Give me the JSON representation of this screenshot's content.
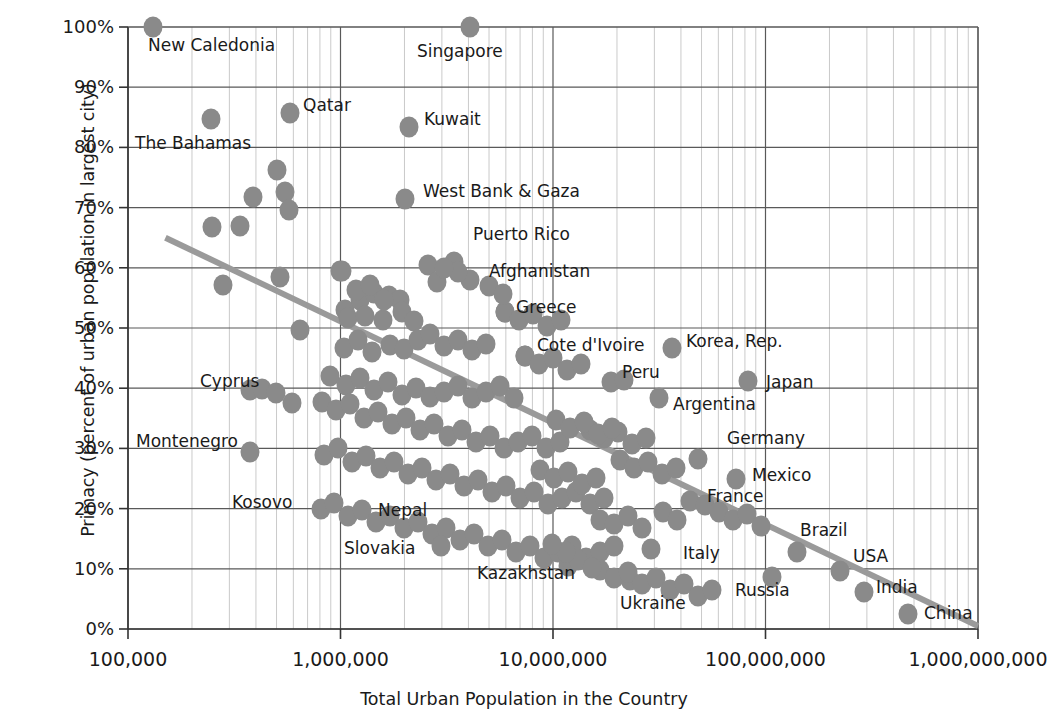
{
  "chart_data": {
    "type": "scatter",
    "title": "",
    "xlabel": "Total Urban Population in the Country",
    "ylabel": "Primacy (percent of urban population in largest city)",
    "xscale": "log",
    "xlim": [
      100000,
      1000000000
    ],
    "ylim": [
      0,
      1.0
    ],
    "grid": true,
    "legend": false,
    "xticklabels": [
      "100,000",
      "1,000,000",
      "10,000,000",
      "100,000,000",
      "1,000,000,000"
    ],
    "xtickvalues": [
      100000,
      1000000,
      10000000,
      100000000,
      1000000000
    ],
    "yticklabels": [
      "0%",
      "10%",
      "20%",
      "30%",
      "40%",
      "50%",
      "60%",
      "70%",
      "80%",
      "90%",
      "100%"
    ],
    "ytickvalues": [
      0,
      10,
      20,
      30,
      40,
      50,
      60,
      70,
      80,
      90,
      100
    ],
    "marker_color": "#8a8a8a",
    "trendline_color": "#9a9a9a",
    "trendline": {
      "x0": 150000,
      "y0": 65.0,
      "x1": 1000000000,
      "y1": 0.5
    },
    "annotations": [
      {
        "label": "New Caledonia",
        "x": 153,
        "y": 27,
        "lx": 148,
        "ly": 46
      },
      {
        "label": "Singapore",
        "x": 470,
        "y": 27,
        "lx": 417,
        "ly": 52
      },
      {
        "label": "Qatar",
        "x": 290,
        "y": 113,
        "lx": 303,
        "ly": 106
      },
      {
        "label": "Kuwait",
        "x": 409,
        "y": 127,
        "lx": 424,
        "ly": 120
      },
      {
        "label": "The Bahamas",
        "x": 211,
        "y": 119,
        "lx": 135,
        "ly": 144
      },
      {
        "label": "West Bank & Gaza",
        "x": 405,
        "y": 199,
        "lx": 423,
        "ly": 192
      },
      {
        "label": "Puerto Rico",
        "x": 454,
        "y": 262,
        "lx": 473,
        "ly": 235
      },
      {
        "label": "Afghanistan",
        "x": 470,
        "y": 280,
        "lx": 489,
        "ly": 272
      },
      {
        "label": "Greece",
        "x": 505,
        "y": 310,
        "lx": 516,
        "ly": 308
      },
      {
        "label": "Cote d'Ivoire",
        "x": 525,
        "y": 355,
        "lx": 537,
        "ly": 346
      },
      {
        "label": "Korea, Rep.",
        "x": 672,
        "y": 348,
        "lx": 686,
        "ly": 342
      },
      {
        "label": "Peru",
        "x": 611,
        "y": 382,
        "lx": 622,
        "ly": 373
      },
      {
        "label": "Japan",
        "x": 748,
        "y": 381,
        "lx": 766,
        "ly": 383
      },
      {
        "label": "Argentina",
        "x": 659,
        "y": 398,
        "lx": 673,
        "ly": 405
      },
      {
        "label": "Germany",
        "x": 698,
        "y": 459,
        "lx": 727,
        "ly": 439
      },
      {
        "label": "Mexico",
        "x": 736,
        "y": 479,
        "lx": 752,
        "ly": 476
      },
      {
        "label": "France",
        "x": 690,
        "y": 501,
        "lx": 707,
        "ly": 497
      },
      {
        "label": "Cyprus",
        "x": 250,
        "y": 390,
        "lx": 200,
        "ly": 382
      },
      {
        "label": "Montenegro",
        "x": 250,
        "y": 452,
        "lx": 136,
        "ly": 442
      },
      {
        "label": "Kosovo",
        "x": 321,
        "y": 509,
        "lx": 232,
        "ly": 503
      },
      {
        "label": "Nepal",
        "x": 441,
        "y": 546,
        "lx": 378,
        "ly": 511
      },
      {
        "label": "Slovakia",
        "x": 441,
        "y": 550,
        "lx": 344,
        "ly": 549
      },
      {
        "label": "Kazakhstan",
        "x": 568,
        "y": 565,
        "lx": 477,
        "ly": 574
      },
      {
        "label": "Italy",
        "x": 651,
        "y": 549,
        "lx": 683,
        "ly": 554
      },
      {
        "label": "Ukraine",
        "x": 630,
        "y": 580,
        "lx": 620,
        "ly": 604
      },
      {
        "label": "Russia",
        "x": 772,
        "y": 577,
        "lx": 735,
        "ly": 591
      },
      {
        "label": "Brazil",
        "x": 797,
        "y": 552,
        "lx": 800,
        "ly": 531
      },
      {
        "label": "USA",
        "x": 840,
        "y": 571,
        "lx": 853,
        "ly": 557
      },
      {
        "label": "India",
        "x": 864,
        "y": 592,
        "lx": 876,
        "ly": 588
      },
      {
        "label": "China",
        "x": 908,
        "y": 614,
        "lx": 924,
        "ly": 614
      }
    ],
    "points_px": [
      [
        153,
        27
      ],
      [
        470,
        27
      ],
      [
        211,
        119
      ],
      [
        290,
        113
      ],
      [
        409,
        127
      ],
      [
        277,
        170
      ],
      [
        285,
        192
      ],
      [
        253,
        197
      ],
      [
        289,
        210
      ],
      [
        212,
        227
      ],
      [
        240,
        226
      ],
      [
        405,
        199
      ],
      [
        223,
        285
      ],
      [
        280,
        277
      ],
      [
        340,
        271
      ],
      [
        454,
        262
      ],
      [
        470,
        280
      ],
      [
        428,
        265
      ],
      [
        437,
        282
      ],
      [
        345,
        310
      ],
      [
        360,
        300
      ],
      [
        374,
        293
      ],
      [
        389,
        296
      ],
      [
        400,
        300
      ],
      [
        348,
        318
      ],
      [
        365,
        316
      ],
      [
        383,
        320
      ],
      [
        402,
        312
      ],
      [
        300,
        330
      ],
      [
        414,
        321
      ],
      [
        344,
        348
      ],
      [
        358,
        340
      ],
      [
        372,
        352
      ],
      [
        390,
        345
      ],
      [
        404,
        349
      ],
      [
        418,
        340
      ],
      [
        430,
        334
      ],
      [
        444,
        346
      ],
      [
        458,
        340
      ],
      [
        472,
        350
      ],
      [
        486,
        344
      ],
      [
        330,
        376
      ],
      [
        346,
        385
      ],
      [
        360,
        378
      ],
      [
        374,
        390
      ],
      [
        388,
        382
      ],
      [
        402,
        395
      ],
      [
        416,
        388
      ],
      [
        430,
        397
      ],
      [
        444,
        392
      ],
      [
        458,
        386
      ],
      [
        472,
        398
      ],
      [
        486,
        392
      ],
      [
        500,
        386
      ],
      [
        514,
        398
      ],
      [
        525,
        356
      ],
      [
        505,
        312
      ],
      [
        322,
        402
      ],
      [
        336,
        410
      ],
      [
        350,
        404
      ],
      [
        364,
        418
      ],
      [
        378,
        412
      ],
      [
        392,
        424
      ],
      [
        406,
        418
      ],
      [
        420,
        430
      ],
      [
        434,
        424
      ],
      [
        448,
        436
      ],
      [
        462,
        430
      ],
      [
        476,
        442
      ],
      [
        490,
        436
      ],
      [
        504,
        448
      ],
      [
        518,
        442
      ],
      [
        532,
        436
      ],
      [
        546,
        448
      ],
      [
        560,
        442
      ],
      [
        250,
        390
      ],
      [
        262,
        389
      ],
      [
        276,
        393
      ],
      [
        292,
        403
      ],
      [
        250,
        452
      ],
      [
        324,
        455
      ],
      [
        338,
        448
      ],
      [
        352,
        462
      ],
      [
        366,
        456
      ],
      [
        380,
        468
      ],
      [
        394,
        462
      ],
      [
        408,
        474
      ],
      [
        422,
        468
      ],
      [
        436,
        480
      ],
      [
        450,
        474
      ],
      [
        464,
        486
      ],
      [
        478,
        480
      ],
      [
        492,
        492
      ],
      [
        506,
        486
      ],
      [
        520,
        498
      ],
      [
        534,
        492
      ],
      [
        548,
        504
      ],
      [
        562,
        498
      ],
      [
        576,
        492
      ],
      [
        590,
        504
      ],
      [
        604,
        498
      ],
      [
        321,
        509
      ],
      [
        334,
        503
      ],
      [
        348,
        516
      ],
      [
        362,
        510
      ],
      [
        376,
        522
      ],
      [
        390,
        516
      ],
      [
        404,
        528
      ],
      [
        418,
        522
      ],
      [
        432,
        534
      ],
      [
        446,
        528
      ],
      [
        460,
        540
      ],
      [
        474,
        534
      ],
      [
        488,
        546
      ],
      [
        502,
        540
      ],
      [
        516,
        552
      ],
      [
        530,
        546
      ],
      [
        544,
        558
      ],
      [
        558,
        552
      ],
      [
        572,
        546
      ],
      [
        586,
        558
      ],
      [
        600,
        552
      ],
      [
        614,
        546
      ],
      [
        441,
        546
      ],
      [
        568,
        566
      ],
      [
        600,
        520
      ],
      [
        614,
        524
      ],
      [
        628,
        516
      ],
      [
        642,
        528
      ],
      [
        611,
        382
      ],
      [
        624,
        380
      ],
      [
        659,
        398
      ],
      [
        672,
        348
      ],
      [
        698,
        459
      ],
      [
        736,
        479
      ],
      [
        690,
        501
      ],
      [
        651,
        549
      ],
      [
        630,
        580
      ],
      [
        663,
        512
      ],
      [
        677,
        520
      ],
      [
        748,
        381
      ],
      [
        772,
        577
      ],
      [
        797,
        552
      ],
      [
        840,
        571
      ],
      [
        864,
        592
      ],
      [
        908,
        614
      ],
      [
        705,
        505
      ],
      [
        719,
        512
      ],
      [
        733,
        520
      ],
      [
        747,
        514
      ],
      [
        761,
        526
      ],
      [
        620,
        460
      ],
      [
        634,
        468
      ],
      [
        648,
        462
      ],
      [
        662,
        474
      ],
      [
        676,
        468
      ],
      [
        590,
        430
      ],
      [
        604,
        438
      ],
      [
        618,
        432
      ],
      [
        632,
        444
      ],
      [
        646,
        438
      ],
      [
        556,
        420
      ],
      [
        570,
        428
      ],
      [
        584,
        422
      ],
      [
        598,
        434
      ],
      [
        612,
        428
      ],
      [
        540,
        470
      ],
      [
        554,
        478
      ],
      [
        568,
        472
      ],
      [
        582,
        484
      ],
      [
        596,
        478
      ],
      [
        525,
        356
      ],
      [
        539,
        364
      ],
      [
        553,
        358
      ],
      [
        567,
        370
      ],
      [
        581,
        364
      ],
      [
        505,
        312
      ],
      [
        519,
        320
      ],
      [
        533,
        314
      ],
      [
        547,
        326
      ],
      [
        561,
        320
      ],
      [
        489,
        286
      ],
      [
        503,
        294
      ],
      [
        458,
        272
      ],
      [
        444,
        268
      ],
      [
        342,
        271
      ],
      [
        356,
        290
      ],
      [
        370,
        285
      ],
      [
        384,
        300
      ],
      [
        600,
        570
      ],
      [
        614,
        578
      ],
      [
        628,
        572
      ],
      [
        642,
        584
      ],
      [
        656,
        578
      ],
      [
        670,
        590
      ],
      [
        684,
        584
      ],
      [
        698,
        596
      ],
      [
        712,
        590
      ],
      [
        578,
        560
      ],
      [
        592,
        568
      ],
      [
        566,
        552
      ],
      [
        552,
        544
      ]
    ]
  }
}
